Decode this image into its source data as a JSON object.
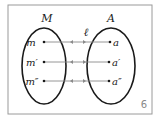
{
  "diagram": {
    "set_left_label": "M",
    "set_right_label": "A",
    "mapping_label": "ℓ",
    "figure_number": "6",
    "left_elements": [
      "m",
      "m′",
      "m″"
    ],
    "right_elements": [
      "a",
      "a′",
      "a″"
    ],
    "colors": {
      "outline": "#1a1a1a",
      "arrow": "#8a8a8a",
      "frame": "#9a9a9a"
    }
  }
}
